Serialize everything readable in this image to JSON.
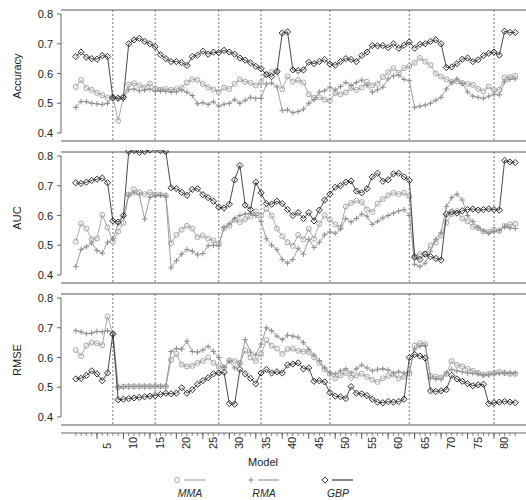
{
  "figure": {
    "xlabel": "Model",
    "width": 526,
    "height": 500
  },
  "legend": {
    "position": "bottom",
    "items": [
      {
        "label": "MMA",
        "marker": "circle-open",
        "color": "#9a9a9a",
        "icon": "circle-marker-icon"
      },
      {
        "label": "RMA",
        "marker": "plus",
        "color": "#8d8d8d",
        "icon": "plus-marker-icon"
      },
      {
        "label": "GBP",
        "marker": "diamond-open",
        "color": "#2b2b2b",
        "icon": "diamond-marker-icon"
      }
    ]
  },
  "colors": {
    "mma": "#9a9a9a",
    "rma": "#8d8d8d",
    "gbp": "#2b2b2b",
    "axis": "#555555",
    "separator": "#666666",
    "background": "#ffffff"
  },
  "chart_data": [
    {
      "type": "line",
      "panel": "accuracy",
      "title": "",
      "xlabel": "Model",
      "ylabel": "Accuracy",
      "xlim": [
        1,
        84
      ],
      "ylim": [
        0.4,
        0.8
      ],
      "yticks": [
        0.4,
        0.5,
        0.6,
        0.7,
        0.8
      ],
      "ytick_labels": [
        "0.4",
        "0.5",
        "0.6",
        "0.7",
        "0.8"
      ],
      "xticks": [
        5,
        10,
        15,
        20,
        25,
        30,
        35,
        40,
        45,
        50,
        55,
        60,
        65,
        70,
        75,
        80
      ],
      "xtick_labels": [
        "5",
        "10",
        "15",
        "20",
        "25",
        "30",
        "35",
        "40",
        "45",
        "50",
        "55",
        "60",
        "65",
        "70",
        "75",
        "80"
      ],
      "grid": false,
      "vlines": [
        8,
        16,
        28,
        36,
        49,
        64,
        80
      ],
      "series": [
        {
          "name": "MMA",
          "marker": "circle-open",
          "color": "#9a9a9a",
          "values": [
            0.555,
            0.578,
            0.551,
            0.545,
            0.535,
            0.527,
            0.518,
            0.522,
            0.441,
            0.52,
            0.563,
            0.567,
            0.56,
            0.553,
            0.566,
            0.549,
            0.546,
            0.548,
            0.545,
            0.548,
            0.552,
            0.57,
            0.58,
            0.578,
            0.565,
            0.553,
            0.547,
            0.538,
            0.552,
            0.548,
            0.565,
            0.58,
            0.572,
            0.569,
            0.56,
            0.57,
            0.598,
            0.605,
            0.608,
            0.547,
            0.59,
            0.573,
            0.578,
            0.57,
            0.53,
            0.518,
            0.52,
            0.512,
            0.508,
            0.534,
            0.53,
            0.536,
            0.551,
            0.545,
            0.553,
            0.572,
            0.56,
            0.565,
            0.588,
            0.604,
            0.618,
            0.602,
            0.618,
            0.625,
            0.636,
            0.652,
            0.64,
            0.628,
            0.6,
            0.59,
            0.58,
            0.572,
            0.574,
            0.568,
            0.565,
            0.562,
            0.548,
            0.54,
            0.556,
            0.544,
            0.545,
            0.586,
            0.588,
            0.592
          ]
        },
        {
          "name": "RMA",
          "marker": "plus",
          "color": "#8d8d8d",
          "values": [
            0.486,
            0.506,
            0.505,
            0.5,
            0.498,
            0.496,
            0.5,
            0.52,
            0.515,
            0.514,
            0.546,
            0.548,
            0.542,
            0.544,
            0.548,
            0.54,
            0.542,
            0.54,
            0.538,
            0.538,
            0.544,
            0.537,
            0.526,
            0.498,
            0.502,
            0.496,
            0.505,
            0.49,
            0.497,
            0.5,
            0.512,
            0.5,
            0.51,
            0.52,
            0.516,
            0.517,
            0.565,
            0.568,
            0.555,
            0.475,
            0.478,
            0.468,
            0.472,
            0.48,
            0.5,
            0.512,
            0.538,
            0.542,
            0.554,
            0.545,
            0.556,
            0.57,
            0.56,
            0.57,
            0.578,
            0.56,
            0.537,
            0.545,
            0.554,
            0.582,
            0.592,
            0.594,
            0.58,
            0.576,
            0.486,
            0.49,
            0.494,
            0.5,
            0.51,
            0.52,
            0.548,
            0.57,
            0.582,
            0.566,
            0.538,
            0.524,
            0.52,
            0.516,
            0.524,
            0.53,
            0.528,
            0.572,
            0.58,
            0.582
          ]
        },
        {
          "name": "GBP",
          "marker": "diamond-open",
          "color": "#2b2b2b",
          "values": [
            0.657,
            0.672,
            0.655,
            0.65,
            0.648,
            0.66,
            0.657,
            0.518,
            0.517,
            0.52,
            0.7,
            0.713,
            0.718,
            0.708,
            0.7,
            0.69,
            0.663,
            0.65,
            0.64,
            0.64,
            0.637,
            0.627,
            0.657,
            0.662,
            0.675,
            0.665,
            0.672,
            0.67,
            0.678,
            0.672,
            0.665,
            0.652,
            0.645,
            0.636,
            0.624,
            0.616,
            0.596,
            0.59,
            0.606,
            0.736,
            0.74,
            0.612,
            0.61,
            0.612,
            0.638,
            0.633,
            0.64,
            0.647,
            0.632,
            0.628,
            0.64,
            0.65,
            0.647,
            0.64,
            0.66,
            0.672,
            0.694,
            0.693,
            0.694,
            0.687,
            0.7,
            0.685,
            0.695,
            0.706,
            0.685,
            0.698,
            0.7,
            0.708,
            0.713,
            0.7,
            0.62,
            0.622,
            0.633,
            0.648,
            0.652,
            0.64,
            0.646,
            0.66,
            0.668,
            0.672,
            0.662,
            0.742,
            0.738,
            0.738
          ]
        }
      ]
    },
    {
      "type": "line",
      "panel": "auc",
      "title": "",
      "xlabel": "Model",
      "ylabel": "AUC",
      "xlim": [
        1,
        84
      ],
      "ylim": [
        0.4,
        0.8
      ],
      "yticks": [
        0.4,
        0.5,
        0.6,
        0.7,
        0.8
      ],
      "ytick_labels": [
        "0.4",
        "0.5",
        "0.6",
        "0.7",
        "0.8"
      ],
      "xticks": [
        5,
        10,
        15,
        20,
        25,
        30,
        35,
        40,
        45,
        50,
        55,
        60,
        65,
        70,
        75,
        80
      ],
      "xtick_labels": [
        "5",
        "10",
        "15",
        "20",
        "25",
        "30",
        "35",
        "40",
        "45",
        "50",
        "55",
        "60",
        "65",
        "70",
        "75",
        "80"
      ],
      "grid": false,
      "vlines": [
        8,
        16,
        28,
        36,
        49,
        64,
        80
      ],
      "series": [
        {
          "name": "MMA",
          "marker": "circle-open",
          "color": "#9a9a9a",
          "values": [
            0.512,
            0.573,
            0.556,
            0.52,
            0.523,
            0.602,
            0.56,
            0.512,
            0.546,
            0.575,
            0.67,
            0.688,
            0.678,
            0.672,
            0.678,
            0.67,
            0.67,
            0.667,
            0.507,
            0.535,
            0.552,
            0.565,
            0.556,
            0.527,
            0.533,
            0.522,
            0.516,
            0.505,
            0.557,
            0.565,
            0.585,
            0.578,
            0.588,
            0.596,
            0.614,
            0.6,
            0.622,
            0.6,
            0.556,
            0.53,
            0.51,
            0.498,
            0.534,
            0.52,
            0.555,
            0.522,
            0.572,
            0.6,
            0.586,
            0.57,
            0.56,
            0.63,
            0.642,
            0.65,
            0.645,
            0.62,
            0.612,
            0.64,
            0.655,
            0.668,
            0.676,
            0.672,
            0.676,
            0.664,
            0.462,
            0.47,
            0.472,
            0.5,
            0.51,
            0.532,
            0.576,
            0.605,
            0.615,
            0.59,
            0.58,
            0.562,
            0.558,
            0.547,
            0.545,
            0.552,
            0.548,
            0.565,
            0.57,
            0.572
          ]
        },
        {
          "name": "RMA",
          "marker": "plus",
          "color": "#8d8d8d",
          "values": [
            0.428,
            0.486,
            0.495,
            0.508,
            0.482,
            0.473,
            0.51,
            0.522,
            0.572,
            0.598,
            0.668,
            0.676,
            0.67,
            0.588,
            0.662,
            0.666,
            0.668,
            0.666,
            0.424,
            0.448,
            0.47,
            0.486,
            0.48,
            0.468,
            0.472,
            0.498,
            0.5,
            0.498,
            0.56,
            0.572,
            0.59,
            0.6,
            0.605,
            0.608,
            0.6,
            0.58,
            0.522,
            0.5,
            0.485,
            0.452,
            0.44,
            0.452,
            0.49,
            0.47,
            0.52,
            0.492,
            0.51,
            0.535,
            0.545,
            0.54,
            0.555,
            0.59,
            0.578,
            0.59,
            0.605,
            0.598,
            0.57,
            0.58,
            0.592,
            0.6,
            0.608,
            0.615,
            0.62,
            0.6,
            0.436,
            0.428,
            0.44,
            0.48,
            0.52,
            0.542,
            0.63,
            0.66,
            0.672,
            0.652,
            0.6,
            0.58,
            0.56,
            0.548,
            0.54,
            0.545,
            0.55,
            0.562,
            0.558,
            0.556
          ]
        },
        {
          "name": "GBP",
          "marker": "diamond-open",
          "color": "#2b2b2b",
          "values": [
            0.71,
            0.708,
            0.712,
            0.718,
            0.722,
            0.726,
            0.71,
            0.582,
            0.578,
            0.6,
            0.815,
            0.818,
            0.812,
            0.815,
            0.82,
            0.825,
            0.818,
            0.815,
            0.693,
            0.69,
            0.678,
            0.668,
            0.688,
            0.69,
            0.67,
            0.66,
            0.648,
            0.628,
            0.625,
            0.638,
            0.72,
            0.768,
            0.635,
            0.62,
            0.712,
            0.676,
            0.64,
            0.638,
            0.648,
            0.64,
            0.62,
            0.6,
            0.61,
            0.59,
            0.61,
            0.582,
            0.618,
            0.652,
            0.672,
            0.695,
            0.7,
            0.712,
            0.716,
            0.682,
            0.676,
            0.69,
            0.73,
            0.742,
            0.715,
            0.72,
            0.74,
            0.742,
            0.73,
            0.718,
            0.46,
            0.452,
            0.47,
            0.462,
            0.456,
            0.45,
            0.605,
            0.612,
            0.608,
            0.616,
            0.62,
            0.622,
            0.618,
            0.62,
            0.622,
            0.62,
            0.618,
            0.785,
            0.78,
            0.778
          ]
        }
      ]
    },
    {
      "type": "line",
      "panel": "rmse",
      "title": "",
      "xlabel": "Model",
      "ylabel": "RMSE",
      "xlim": [
        1,
        84
      ],
      "ylim": [
        0.4,
        0.8
      ],
      "yticks": [
        0.4,
        0.5,
        0.6,
        0.7,
        0.8
      ],
      "ytick_labels": [
        "0.4",
        "0.5",
        "0.6",
        "0.7",
        "0.8"
      ],
      "xticks": [
        5,
        10,
        15,
        20,
        25,
        30,
        35,
        40,
        45,
        50,
        55,
        60,
        65,
        70,
        75,
        80
      ],
      "xtick_labels": [
        "5",
        "10",
        "15",
        "20",
        "25",
        "30",
        "35",
        "40",
        "45",
        "50",
        "55",
        "60",
        "65",
        "70",
        "75",
        "80"
      ],
      "grid": false,
      "vlines": [
        8,
        16,
        28,
        36,
        49,
        64,
        80
      ],
      "series": [
        {
          "name": "MMA",
          "marker": "circle-open",
          "color": "#9a9a9a",
          "values": [
            0.625,
            0.605,
            0.64,
            0.65,
            0.648,
            0.642,
            0.738,
            0.68,
            0.5,
            0.502,
            0.503,
            0.503,
            0.503,
            0.503,
            0.503,
            0.503,
            0.503,
            0.503,
            0.592,
            0.612,
            0.576,
            0.57,
            0.572,
            0.582,
            0.588,
            0.6,
            0.582,
            0.57,
            0.566,
            0.59,
            0.588,
            0.582,
            0.624,
            0.6,
            0.588,
            0.612,
            0.658,
            0.64,
            0.63,
            0.612,
            0.628,
            0.63,
            0.622,
            0.62,
            0.618,
            0.6,
            0.582,
            0.56,
            0.545,
            0.53,
            0.54,
            0.548,
            0.532,
            0.54,
            0.546,
            0.535,
            0.525,
            0.518,
            0.53,
            0.538,
            0.542,
            0.53,
            0.535,
            0.545,
            0.64,
            0.648,
            0.645,
            0.538,
            0.535,
            0.533,
            0.545,
            0.588,
            0.575,
            0.57,
            0.562,
            0.555,
            0.548,
            0.542,
            0.545,
            0.548,
            0.552,
            0.548,
            0.545,
            0.545
          ]
        },
        {
          "name": "RMA",
          "marker": "plus",
          "color": "#8d8d8d",
          "values": [
            0.69,
            0.686,
            0.68,
            0.682,
            0.688,
            0.686,
            0.69,
            0.682,
            0.5,
            0.502,
            0.503,
            0.503,
            0.503,
            0.503,
            0.503,
            0.503,
            0.503,
            0.503,
            0.62,
            0.63,
            0.628,
            0.655,
            0.62,
            0.618,
            0.625,
            0.638,
            0.62,
            0.6,
            0.566,
            0.588,
            0.565,
            0.578,
            0.66,
            0.618,
            0.608,
            0.645,
            0.7,
            0.69,
            0.672,
            0.66,
            0.675,
            0.672,
            0.668,
            0.65,
            0.628,
            0.608,
            0.59,
            0.565,
            0.548,
            0.545,
            0.555,
            0.562,
            0.548,
            0.562,
            0.575,
            0.565,
            0.555,
            0.56,
            0.562,
            0.558,
            0.548,
            0.552,
            0.548,
            0.552,
            0.628,
            0.638,
            0.64,
            0.53,
            0.528,
            0.526,
            0.548,
            0.56,
            0.555,
            0.552,
            0.548,
            0.546,
            0.545,
            0.54,
            0.542,
            0.544,
            0.546,
            0.548,
            0.548,
            0.548
          ]
        },
        {
          "name": "GBP",
          "marker": "diamond-open",
          "color": "#2b2b2b",
          "values": [
            0.528,
            0.53,
            0.54,
            0.555,
            0.545,
            0.522,
            0.548,
            0.678,
            0.458,
            0.46,
            0.462,
            0.464,
            0.466,
            0.468,
            0.47,
            0.472,
            0.476,
            0.48,
            0.478,
            0.48,
            0.498,
            0.48,
            0.492,
            0.51,
            0.522,
            0.532,
            0.545,
            0.548,
            0.55,
            0.445,
            0.443,
            0.56,
            0.545,
            0.53,
            0.512,
            0.548,
            0.56,
            0.548,
            0.552,
            0.548,
            0.575,
            0.578,
            0.582,
            0.562,
            0.565,
            0.52,
            0.522,
            0.518,
            0.482,
            0.47,
            0.468,
            0.462,
            0.502,
            0.48,
            0.478,
            0.472,
            0.46,
            0.45,
            0.448,
            0.452,
            0.45,
            0.452,
            0.46,
            0.6,
            0.61,
            0.605,
            0.598,
            0.488,
            0.486,
            0.488,
            0.492,
            0.54,
            0.528,
            0.52,
            0.512,
            0.505,
            0.508,
            0.51,
            0.445,
            0.448,
            0.45,
            0.452,
            0.45,
            0.448
          ]
        }
      ]
    }
  ]
}
